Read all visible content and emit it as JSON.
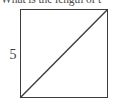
{
  "figure": {
    "question": "What is the length of t",
    "shape_name": "square",
    "side_label": "5",
    "diagonal_label": "",
    "line_color": "#3d3d3d",
    "text_color": "#4d4d4d",
    "background_color": "#ffffff",
    "diagonal": {
      "from": "bottom-left",
      "to": "top-right"
    }
  }
}
